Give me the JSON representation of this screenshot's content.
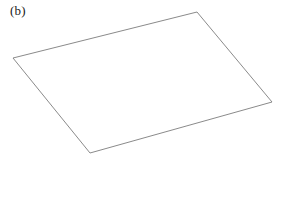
{
  "figure": {
    "panel_label": "(b)",
    "background_color": "#ffffff",
    "width": 283,
    "height": 207
  },
  "chart_data": {
    "type": "line",
    "title": "(b)",
    "subtitle": "",
    "xlabel": "",
    "ylabel": "",
    "grid": false,
    "legend": null,
    "axes_visible": false,
    "tick_labels": [],
    "annotations": [],
    "series": [
      {
        "name": "plane-outline",
        "closed": true,
        "stroke_color": "#7d7d7d",
        "stroke_width": 0.9,
        "fill_color": "none",
        "points": [
          {
            "name": "top-vertex",
            "x": 197,
            "y": 12
          },
          {
            "name": "right-vertex",
            "x": 272,
            "y": 102
          },
          {
            "name": "bottom-vertex",
            "x": 90,
            "y": 153
          },
          {
            "name": "left-vertex",
            "x": 13,
            "y": 58
          }
        ]
      }
    ],
    "xlim": [
      0,
      283
    ],
    "ylim": [
      0,
      207
    ]
  }
}
